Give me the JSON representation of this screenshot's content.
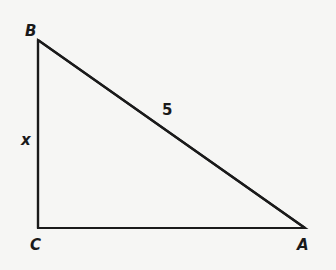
{
  "diagram": {
    "type": "right-triangle",
    "vertices": [
      {
        "id": "B",
        "label": "B",
        "x": 38,
        "y": 40
      },
      {
        "id": "C",
        "label": "C",
        "x": 38,
        "y": 228
      },
      {
        "id": "A",
        "label": "A",
        "x": 305,
        "y": 228
      }
    ],
    "right_angle_at": "C",
    "sides": {
      "BC": {
        "label": "x"
      },
      "AB": {
        "label": "5"
      },
      "CA": {
        "label": ""
      }
    },
    "stroke_color": "#1a1a1a",
    "background_color": "#f6f6f4"
  }
}
